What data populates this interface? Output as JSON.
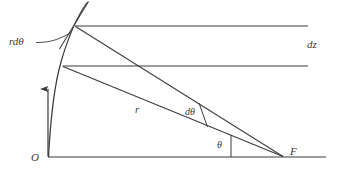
{
  "figure": {
    "type": "geometry-diagram",
    "background_color": "#ffffff",
    "stroke_color": "#3b3b3b",
    "canvas": {
      "width": 341,
      "height": 175
    }
  },
  "labels": {
    "arc_element": "rdθ",
    "vertical_element": "dz",
    "radius": "r",
    "angle_increment": "dθ",
    "angle": "θ",
    "origin": "O",
    "focus": "F"
  },
  "points": {
    "origin": {
      "name": "O",
      "x": 48,
      "y": 157
    },
    "focus": {
      "name": "F",
      "x": 283,
      "y": 157
    },
    "upper_intersection": {
      "x": 76,
      "y": 26
    },
    "lower_intersection": {
      "x": 63,
      "y": 66
    }
  },
  "elements": [
    {
      "name": "baseline-axis",
      "kind": "line",
      "from": [
        48,
        157
      ],
      "to": [
        325,
        157
      ]
    },
    {
      "name": "vertical-arrow",
      "kind": "arrow",
      "from": [
        48,
        157
      ],
      "to": [
        48,
        80
      ]
    },
    {
      "name": "parabolic-curve",
      "kind": "curve",
      "from": [
        48,
        157
      ],
      "to": [
        87,
        2
      ]
    },
    {
      "name": "tangent-line",
      "kind": "line",
      "from": [
        88,
        2
      ],
      "to": [
        60,
        48
      ]
    },
    {
      "name": "upper-horizontal-line",
      "kind": "line",
      "from": [
        76,
        26
      ],
      "to": [
        308,
        26
      ]
    },
    {
      "name": "lower-horizontal-line",
      "kind": "line",
      "from": [
        63,
        66
      ],
      "to": [
        308,
        66
      ]
    },
    {
      "name": "ray-upper",
      "kind": "line",
      "from": [
        283,
        157
      ],
      "to": [
        76,
        26
      ]
    },
    {
      "name": "ray-lower",
      "kind": "line",
      "from": [
        283,
        157
      ],
      "to": [
        63,
        66
      ]
    },
    {
      "name": "angle-tick-dtheta",
      "kind": "tick",
      "from": [
        200,
        104
      ],
      "to": [
        207,
        127
      ]
    },
    {
      "name": "angle-tick-theta",
      "kind": "tick",
      "from": [
        231,
        136
      ],
      "to": [
        231,
        157
      ]
    },
    {
      "name": "leader-line-rdtheta",
      "kind": "leader",
      "from": [
        38,
        42
      ],
      "to": [
        71,
        33
      ]
    }
  ]
}
